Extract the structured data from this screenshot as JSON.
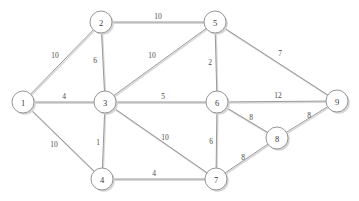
{
  "figure": {
    "background_color": "#ffffff",
    "node_stroke_color": "#8a8a8a",
    "node_fill_color": "#ffffff",
    "edge_color": "#8e8e8e",
    "shadow_color": "#d5d5d5",
    "label_color": "#3a3a3a"
  },
  "chart_data": {
    "type": "diagram",
    "subtype": "weighted-undirected-graph",
    "xlabel": "",
    "ylabel": "",
    "grid": false,
    "legend": null,
    "node_radius": 11,
    "node_count": 9,
    "edge_count": 17,
    "nodes": [
      {
        "id": "1",
        "label": "1",
        "x": 23,
        "y": 102
      },
      {
        "id": "2",
        "label": "2",
        "x": 101,
        "y": 22
      },
      {
        "id": "3",
        "label": "3",
        "x": 105,
        "y": 102
      },
      {
        "id": "4",
        "label": "4",
        "x": 102,
        "y": 179
      },
      {
        "id": "5",
        "label": "5",
        "x": 215,
        "y": 22
      },
      {
        "id": "6",
        "label": "6",
        "x": 217,
        "y": 102
      },
      {
        "id": "7",
        "label": "7",
        "x": 216,
        "y": 179
      },
      {
        "id": "8",
        "label": "8",
        "x": 277,
        "y": 138
      },
      {
        "id": "9",
        "label": "9",
        "x": 337,
        "y": 101
      }
    ],
    "edges": [
      {
        "source": "1",
        "target": "2",
        "weight": 10,
        "label": "10",
        "label_x": 55,
        "label_y": 55
      },
      {
        "source": "1",
        "target": "3",
        "weight": 4,
        "label": "4",
        "label_x": 64,
        "label_y": 96
      },
      {
        "source": "1",
        "target": "4",
        "weight": 10,
        "label": "10",
        "label_x": 54,
        "label_y": 144
      },
      {
        "source": "2",
        "target": "5",
        "weight": 10,
        "label": "10",
        "label_x": 158,
        "label_y": 16
      },
      {
        "source": "2",
        "target": "3",
        "weight": 6,
        "label": "6",
        "label_x": 95,
        "label_y": 60
      },
      {
        "source": "3",
        "target": "5",
        "weight": 10,
        "label": "10",
        "label_x": 152,
        "label_y": 55
      },
      {
        "source": "3",
        "target": "6",
        "weight": 5,
        "label": "5",
        "label_x": 163,
        "label_y": 96
      },
      {
        "source": "3",
        "target": "4",
        "weight": 1,
        "label": "1",
        "label_x": 98,
        "label_y": 142
      },
      {
        "source": "3",
        "target": "7",
        "weight": 10,
        "label": "10",
        "label_x": 165,
        "label_y": 137
      },
      {
        "source": "4",
        "target": "7",
        "weight": 4,
        "label": "4",
        "label_x": 154,
        "label_y": 173
      },
      {
        "source": "5",
        "target": "6",
        "weight": 2,
        "label": "2",
        "label_x": 210,
        "label_y": 62
      },
      {
        "source": "5",
        "target": "9",
        "weight": 7,
        "label": "7",
        "label_x": 280,
        "label_y": 53
      },
      {
        "source": "6",
        "target": "9",
        "weight": 12,
        "label": "12",
        "label_x": 278,
        "label_y": 95
      },
      {
        "source": "6",
        "target": "8",
        "weight": 8,
        "label": "8",
        "label_x": 251,
        "label_y": 117
      },
      {
        "source": "6",
        "target": "7",
        "weight": 6,
        "label": "6",
        "label_x": 211,
        "label_y": 141
      },
      {
        "source": "7",
        "target": "8",
        "weight": 8,
        "label": "8",
        "label_x": 243,
        "label_y": 157
      },
      {
        "source": "8",
        "target": "9",
        "weight": 8,
        "label": "8",
        "label_x": 309,
        "label_y": 115
      }
    ]
  }
}
